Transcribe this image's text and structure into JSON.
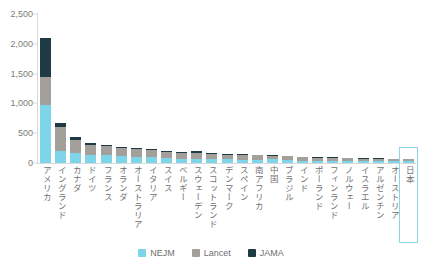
{
  "chart_data": {
    "type": "bar",
    "subtype": "stacked-vertical",
    "title": "",
    "xlabel": "",
    "ylabel": "",
    "ylim": [
      0,
      2500
    ],
    "ytick_values": [
      0,
      500,
      1000,
      1500,
      2000,
      2500
    ],
    "ytick_labels": [
      "0",
      "500",
      "1,000",
      "1,500",
      "2,000",
      "2,500"
    ],
    "grid": false,
    "legend_position": "bottom-center",
    "categories": [
      "アメリカ",
      "イングランド",
      "カナダ",
      "ドイツ",
      "フランス",
      "オランダ",
      "オーストラリア",
      "イタリア",
      "スイス",
      "ベルギー",
      "スウェーデン",
      "スコットランド",
      "デンマーク",
      "スペイン",
      "南アフリカ",
      "中国",
      "ブラジル",
      "インド",
      "ポーランド",
      "フィンランド",
      "ノルウェー",
      "イスラエル",
      "アルゼンチン",
      "オーストリア",
      "日本"
    ],
    "series": [
      {
        "name": "NEJM",
        "color": "#7ed4e8",
        "values": [
          980,
          205,
          175,
          140,
          130,
          120,
          105,
          95,
          80,
          75,
          70,
          68,
          62,
          58,
          55,
          60,
          48,
          42,
          40,
          38,
          35,
          32,
          30,
          28,
          30
        ]
      },
      {
        "name": "Lancet",
        "color": "#a3a09c",
        "values": [
          460,
          400,
          205,
          165,
          150,
          135,
          130,
          120,
          108,
          100,
          95,
          88,
          80,
          78,
          72,
          60,
          62,
          55,
          52,
          48,
          45,
          42,
          40,
          38,
          34
        ]
      },
      {
        "name": "JAMA",
        "color": "#1e3b45",
        "values": [
          660,
          70,
          50,
          28,
          25,
          22,
          20,
          18,
          17,
          16,
          40,
          15,
          14,
          13,
          12,
          10,
          11,
          10,
          9,
          9,
          8,
          8,
          7,
          7,
          7
        ]
      }
    ],
    "totals": [
      2100,
      675,
      430,
      333,
      305,
      277,
      255,
      233,
      205,
      191,
      205,
      171,
      156,
      149,
      139,
      130,
      121,
      107,
      101,
      95,
      88,
      82,
      77,
      73,
      71
    ],
    "highlighted_category": "日本",
    "highlight_color": "#8ed3e6"
  },
  "legend": {
    "items": [
      {
        "label": "NEJM",
        "color": "#7ed4e8"
      },
      {
        "label": "Lancet",
        "color": "#a3a09c"
      },
      {
        "label": "JAMA",
        "color": "#1e3b45"
      }
    ]
  }
}
